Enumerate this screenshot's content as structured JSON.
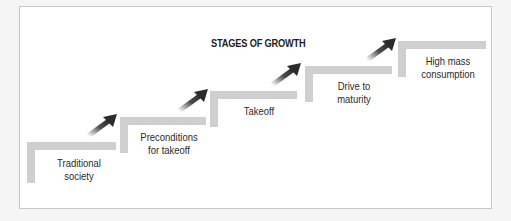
{
  "diagram": {
    "title": "STAGES OF GROWTH",
    "colors": {
      "step_fill": "#cfcfcf",
      "arrow": "#2b2b2b",
      "text": "#2a2a2a",
      "frame_border": "#c8c8c8"
    },
    "stages": [
      {
        "line1": "Traditional",
        "line2": "society"
      },
      {
        "line1": "Preconditions",
        "line2": "for takeoff"
      },
      {
        "line1": "Takeoff",
        "line2": ""
      },
      {
        "line1": "Drive to",
        "line2": "maturity"
      },
      {
        "line1": "High mass",
        "line2": "consumption"
      }
    ],
    "arrow_icon": "up-right-arrow"
  }
}
